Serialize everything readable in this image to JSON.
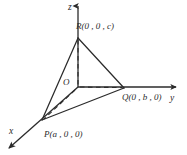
{
  "figure": {
    "background_color": "#ffffff",
    "stroke_color": "#2b2b2b",
    "axes": {
      "z": {
        "label": "z",
        "direction": "up"
      },
      "y": {
        "label": "y",
        "direction": "right"
      },
      "x": {
        "label": "x",
        "direction": "down-left"
      }
    },
    "origin": {
      "label": "O"
    },
    "points": [
      {
        "name": "R",
        "label": "R(0 , 0 , c)",
        "axis": "z"
      },
      {
        "name": "Q",
        "label": "Q(0 , b , 0)",
        "axis": "y"
      },
      {
        "name": "P",
        "label": "P(a , 0 , 0)",
        "axis": "x"
      }
    ],
    "edges": [
      {
        "from": "R",
        "to": "Q",
        "style": "solid"
      },
      {
        "from": "R",
        "to": "P",
        "style": "solid"
      },
      {
        "from": "P",
        "to": "Q",
        "style": "solid"
      }
    ],
    "construction_lines": [
      {
        "from": "R",
        "to": "O",
        "style": "dashed"
      },
      {
        "from": "O",
        "to": "Q",
        "style": "dashed"
      },
      {
        "from": "O",
        "to": "P",
        "style": "dashed"
      }
    ]
  }
}
